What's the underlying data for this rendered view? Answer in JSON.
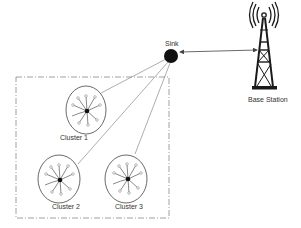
{
  "diagram": {
    "sink": {
      "label": "Sink",
      "x": 171,
      "y": 56,
      "r": 7
    },
    "base_station": {
      "label": "Base Station",
      "x": 264
    },
    "link": {
      "from": "Sink",
      "to": "Base Station",
      "type": "bidirectional"
    },
    "region": {
      "style": "dash-dot",
      "x": 16,
      "y": 77,
      "w": 153,
      "h": 141
    },
    "clusters": [
      {
        "label": "Cluster 1",
        "cx": 86,
        "cy": 110,
        "rx": 20,
        "ry": 24
      },
      {
        "label": "Cluster 2",
        "cx": 59,
        "cy": 179,
        "rx": 21,
        "ry": 24
      },
      {
        "label": "Cluster 3",
        "cx": 126,
        "cy": 179,
        "rx": 21,
        "ry": 24
      }
    ],
    "colors": {
      "line": "#555555",
      "node": "#111111",
      "tower": "#1a1a1a"
    }
  }
}
